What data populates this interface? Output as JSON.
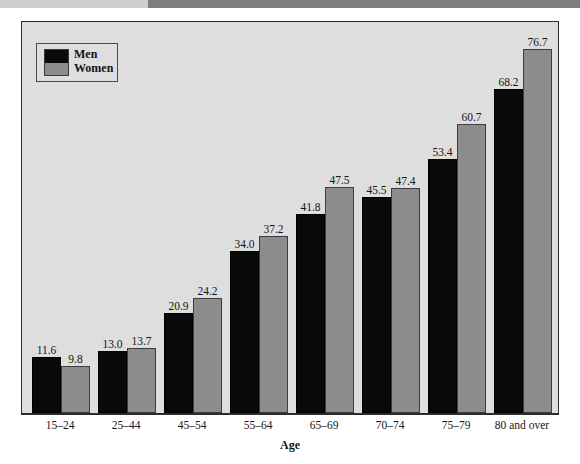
{
  "chart_data": {
    "type": "bar",
    "title": "",
    "xlabel": "Age",
    "ylabel": "",
    "ylim": [
      0,
      83
    ],
    "grid": false,
    "legend_position": "top-left",
    "categories": [
      "15–24",
      "25–44",
      "45–54",
      "55–64",
      "65–69",
      "70–74",
      "75–79",
      "80 and over"
    ],
    "series": [
      {
        "name": "Men",
        "color": "#090909",
        "values": [
          11.6,
          13.0,
          20.9,
          34.0,
          41.8,
          45.5,
          53.4,
          68.2
        ]
      },
      {
        "name": "Women",
        "color": "#8c8c8c",
        "values": [
          9.8,
          13.7,
          24.2,
          37.2,
          47.5,
          47.4,
          60.7,
          76.7
        ]
      }
    ],
    "value_labels": {
      "men": [
        "11.6",
        "13.0",
        "20.9",
        "34.0",
        "41.8",
        "45.5",
        "53.4",
        "68.2"
      ],
      "women": [
        "9.8",
        "13.7",
        "24.2",
        "37.2",
        "47.5",
        "47.4",
        "60.7",
        "76.7"
      ]
    }
  },
  "legend": {
    "men_label": "Men",
    "women_label": "Women"
  },
  "axis": {
    "x_title": "Age"
  },
  "colors": {
    "men_bar": "#090909",
    "women_bar": "#8c8c8c",
    "plot_background": "#dedede",
    "frame_border": "#2b2b2b",
    "page_background": "#ffffff",
    "scan_band_left": "#cfcfcf",
    "scan_band_right": "#7d7d7d"
  }
}
